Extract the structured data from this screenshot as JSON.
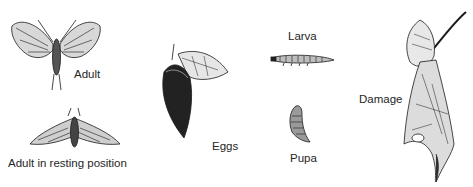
{
  "figure": {
    "stages": [
      {
        "id": "adult",
        "label": "Adult"
      },
      {
        "id": "adult-resting",
        "label": "Adult in resting position"
      },
      {
        "id": "eggs",
        "label": "Eggs"
      },
      {
        "id": "larva",
        "label": "Larva"
      },
      {
        "id": "pupa",
        "label": "Pupa"
      },
      {
        "id": "damage",
        "label": "Damage"
      }
    ],
    "colors": {
      "ink": "#1a1a1a",
      "paper": "#ffffff"
    }
  }
}
